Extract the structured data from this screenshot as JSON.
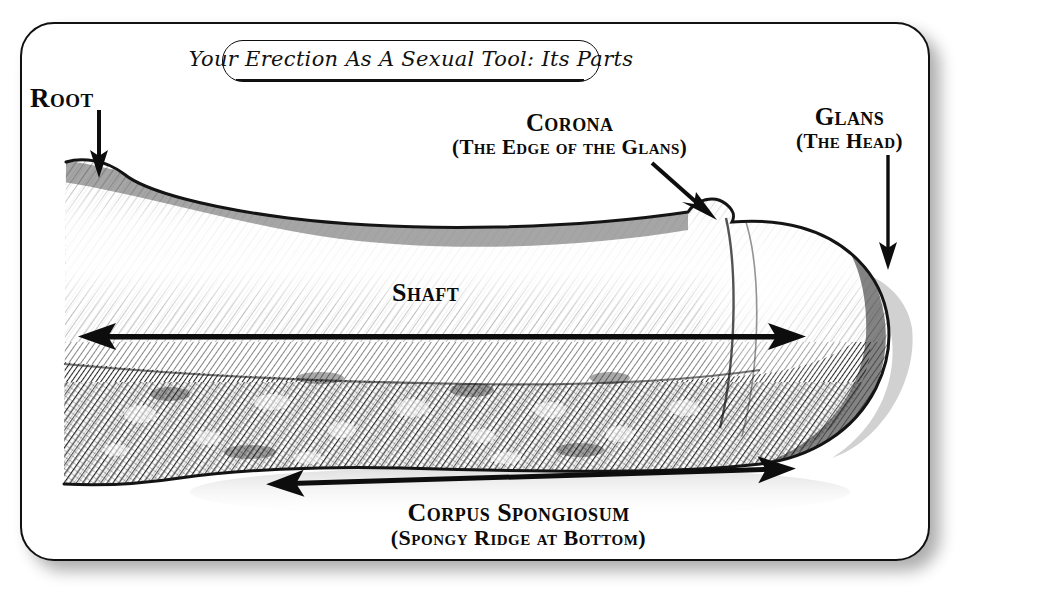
{
  "figure": {
    "title": "Your Erection As A Sexual Tool: Its Parts",
    "type": "anatomical-line-drawing",
    "medium": "pen-and-ink hatching illustration",
    "frame_shape": "rounded-rectangle"
  },
  "labels": {
    "root": "Root",
    "corona": "Corona",
    "corona_sub": "(The Edge of the Glans)",
    "glans": "Glans",
    "glans_sub": "(The Head)",
    "shaft": "Shaft",
    "corpus": "Corpus Spongiosum",
    "corpus_sub": "(Spongy Ridge at Bottom)"
  },
  "annotations": [
    {
      "name": "root-pointer",
      "style": "straight-arrow",
      "direction": "down",
      "from": [
        99,
        110
      ],
      "to": [
        99,
        172
      ]
    },
    {
      "name": "corona-pointer",
      "style": "straight-arrow",
      "direction": "down-right",
      "from": [
        652,
        163
      ],
      "to": [
        712,
        216
      ]
    },
    {
      "name": "glans-pointer",
      "style": "straight-arrow",
      "direction": "down",
      "from": [
        888,
        155
      ],
      "to": [
        888,
        265
      ]
    },
    {
      "name": "shaft-extent",
      "style": "double-headed-arrow",
      "direction": "horizontal",
      "from": [
        86,
        336
      ],
      "to": [
        790,
        336
      ]
    },
    {
      "name": "corpus-spongiosum-extent",
      "style": "double-headed-arrow",
      "direction": "horizontal",
      "from": [
        266,
        486
      ],
      "to": [
        790,
        470
      ]
    }
  ],
  "colors": {
    "ink": "#111111",
    "paper": "#ffffff",
    "shadow": "rgba(0,0,0,0.32)",
    "hatch_dark": "#2a2a2a",
    "hatch_mid": "#6d6d6d",
    "hatch_light": "#b9b9b9"
  }
}
